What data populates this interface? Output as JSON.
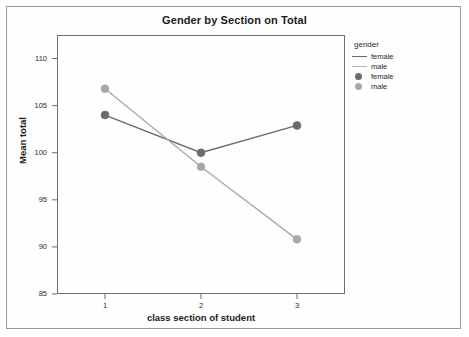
{
  "chart_data": {
    "type": "line",
    "title": "Gender by Section on Total",
    "xlabel": "class section of student",
    "ylabel": "Mean total",
    "categories": [
      "1",
      "2",
      "3"
    ],
    "x_tick_labels": [
      "1",
      "2",
      "3"
    ],
    "y_tick_labels": [
      "85",
      "90",
      "95",
      "100",
      "105",
      "110"
    ],
    "y_tick_values": [
      85,
      90,
      95,
      100,
      105,
      110
    ],
    "ylim": [
      85,
      112.5
    ],
    "xlim": [
      0.5,
      3.5
    ],
    "grid": false,
    "legend_position": "right",
    "legend_title": "gender",
    "series": [
      {
        "name": "female",
        "color": "#6b6b6b",
        "marker": "circle",
        "values": [
          104.0,
          100.0,
          102.9
        ]
      },
      {
        "name": "male",
        "color": "#a8a8a8",
        "marker": "circle",
        "values": [
          106.8,
          98.5,
          90.8
        ]
      }
    ]
  },
  "title": {
    "text": "Gender by Section on Total"
  },
  "axes": {
    "y_title": "Mean total",
    "x_title": "class section of student",
    "y_ticks": [
      {
        "label": "110",
        "value": 110
      },
      {
        "label": "105",
        "value": 105
      },
      {
        "label": "100",
        "value": 100
      },
      {
        "label": "95",
        "value": 95
      },
      {
        "label": "90",
        "value": 90
      },
      {
        "label": "85",
        "value": 85
      }
    ],
    "x_ticks": [
      {
        "label": "1",
        "value": 1
      },
      {
        "label": "2",
        "value": 2
      },
      {
        "label": "3",
        "value": 3
      }
    ]
  },
  "legend": {
    "title": "gender",
    "entries": [
      {
        "label": "female",
        "kind": "line",
        "color": "#6b6b6b"
      },
      {
        "label": "male",
        "kind": "line",
        "color": "#b5b5b5"
      },
      {
        "label": "female",
        "kind": "marker",
        "color": "#6b6b6b"
      },
      {
        "label": "male",
        "kind": "marker",
        "color": "#a8a8a8"
      }
    ]
  },
  "colors": {
    "female": "#6b6b6b",
    "male": "#a8a8a8",
    "frame": "#6d6d6d",
    "page_border": "#9a9a9a",
    "text": "#1b1b1b"
  }
}
